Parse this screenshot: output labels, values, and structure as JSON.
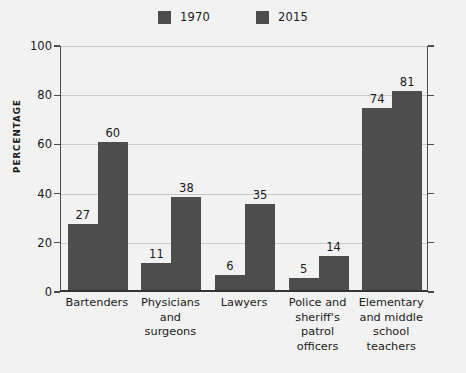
{
  "chart_data": {
    "type": "bar",
    "title": "",
    "subtitle": "",
    "xlabel": "",
    "ylabel": "PERCENTAGE",
    "ylim": [
      0,
      100
    ],
    "yticks": [
      0,
      20,
      40,
      60,
      80,
      100
    ],
    "ytick_labels": [
      "0",
      "20",
      "40",
      "60",
      "80",
      "100"
    ],
    "grid": true,
    "legend_position": "top-center",
    "categories": [
      "Bartenders",
      "Physicians and surgeons",
      "Lawyers",
      "Police and sheriff's patrol officers",
      "Elementary and middle school teachers"
    ],
    "category_lines": [
      [
        "Bartenders"
      ],
      [
        "Physicians",
        "and surgeons"
      ],
      [
        "Lawyers"
      ],
      [
        "Police and",
        "sheriff's",
        "patrol",
        "officers"
      ],
      [
        "Elementary",
        "and middle",
        "school",
        "teachers"
      ]
    ],
    "series": [
      {
        "name": "1970",
        "color": "#4d4d4d",
        "values": [
          27,
          11,
          6,
          5,
          74
        ]
      },
      {
        "name": "2015",
        "color": "#4d4d4d",
        "values": [
          60,
          38,
          35,
          14,
          81
        ]
      }
    ],
    "value_labels": [
      [
        "27",
        "60"
      ],
      [
        "11",
        "38"
      ],
      [
        "6",
        "35"
      ],
      [
        "5",
        "14"
      ],
      [
        "74",
        "81"
      ]
    ]
  },
  "legend": {
    "entries": [
      {
        "label": "1970",
        "color": "#4d4d4d"
      },
      {
        "label": "2015",
        "color": "#4d4d4d"
      }
    ]
  },
  "colors": {
    "background": "#f2f2f2",
    "bar": "#4d4d4d",
    "gridline": "#c9c9c9",
    "axis": "#4a4a4a",
    "baseline": "#333333",
    "text": "#1a1a1a"
  }
}
